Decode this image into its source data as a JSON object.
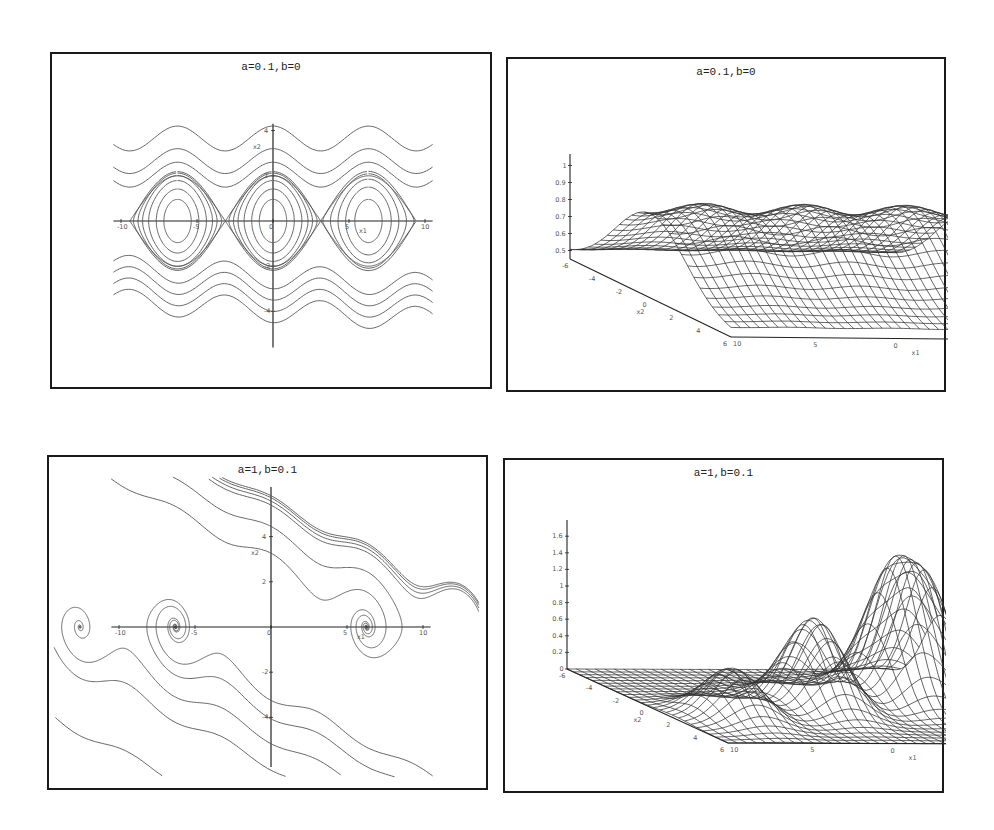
{
  "figure": {
    "panels": [
      {
        "id": "p1",
        "title": "a=0.1,b=0",
        "kind": "phase-portrait"
      },
      {
        "id": "p2",
        "title": "a=0.1,b=0",
        "kind": "surface"
      },
      {
        "id": "p3",
        "title": "a=1,b=0.1",
        "kind": "phase-portrait"
      },
      {
        "id": "p4",
        "title": "a=1,b=0.1",
        "kind": "surface"
      }
    ]
  },
  "chart_data": [
    {
      "type": "line",
      "title": "a=0.1,b=0",
      "xlabel": "x1",
      "ylabel": "x2",
      "xlim": [
        -10,
        10
      ],
      "ylim": [
        -6,
        6
      ],
      "x_ticks": [
        "-10",
        "-5",
        "0",
        "5",
        "10"
      ],
      "y_ticks": [
        "4",
        "2",
        "0",
        "-2",
        "-4"
      ],
      "description": "Phase portrait with closed orbits (centers) around x1 = -2π, 0, 2π and wavy open trajectories above and below",
      "centers_x1": [
        -6.28,
        0,
        6.28
      ],
      "grid": false
    },
    {
      "type": "surface",
      "title": "a=0.1,b=0",
      "xlabel": "x1",
      "ylabel": "x2",
      "zlabel": "",
      "x_ticks": [
        "10",
        "5",
        "0",
        "-5",
        "-10"
      ],
      "y_ticks": [
        "-6",
        "-4",
        "-2",
        "0",
        "2",
        "4",
        "6"
      ],
      "z_ticks": [
        "0.5",
        "0.6",
        "0.7",
        "0.8",
        "0.9",
        "1"
      ],
      "zlim": [
        0.45,
        1.0
      ],
      "description": "Wireframe ridge along x1 with shallow periodic bumps; maximum ~1 near x2 = 0"
    },
    {
      "type": "line",
      "title": "a=1,b=0.1",
      "xlabel": "x1",
      "ylabel": "x2",
      "xlim": [
        -10,
        10
      ],
      "ylim": [
        -6,
        6
      ],
      "x_ticks": [
        "-10",
        "-5",
        "0",
        "5",
        "10"
      ],
      "y_ticks": [
        "4",
        "2",
        "0",
        "-2",
        "-4"
      ],
      "description": "Phase portrait with trajectories spiraling into stable foci at x1 = -2π, 0, 2π; slanted separatrix-like curves",
      "foci_x1": [
        -6.28,
        0,
        6.28
      ],
      "grid": false
    },
    {
      "type": "surface",
      "title": "a=1,b=0.1",
      "xlabel": "x1",
      "ylabel": "x2",
      "zlabel": "",
      "x_ticks": [
        "10",
        "5",
        "0",
        "-5",
        "-10"
      ],
      "y_ticks": [
        "-6",
        "-4",
        "-2",
        "0",
        "2",
        "4",
        "6"
      ],
      "z_ticks": [
        "0",
        "0.2",
        "0.4",
        "0.6",
        "0.8",
        "1",
        "1.2",
        "1.4",
        "1.6"
      ],
      "zlim": [
        0,
        1.7
      ],
      "description": "Wireframe surface with three peaks along x1 (heights ~0.8, ~1.2, ~1.6), near zero elsewhere"
    }
  ]
}
